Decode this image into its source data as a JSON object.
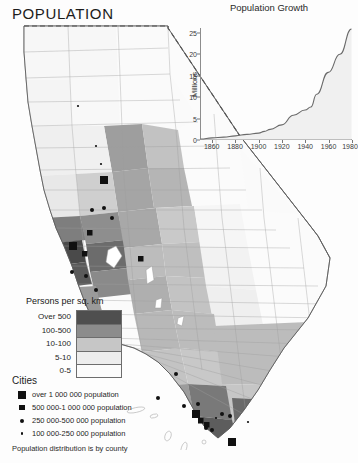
{
  "title": "POPULATION",
  "footnote": "Population distribution is by county",
  "chart_data": {
    "type": "area",
    "title": "Population Growth",
    "xlabel": "",
    "ylabel": "Millions",
    "xlim": [
      1850,
      1980
    ],
    "ylim": [
      0,
      26
    ],
    "xticks": [
      "1860",
      "1880",
      "1900",
      "1920",
      "1940",
      "1960",
      "1980"
    ],
    "yticks": [
      "0",
      "5",
      "10",
      "15",
      "20",
      "25"
    ],
    "grid": false,
    "legend": "none",
    "x": [
      1850,
      1860,
      1870,
      1880,
      1890,
      1900,
      1905,
      1910,
      1920,
      1930,
      1940,
      1945,
      1950,
      1960,
      1970,
      1980
    ],
    "values": [
      0.1,
      0.38,
      0.56,
      0.86,
      1.21,
      1.49,
      1.9,
      2.38,
      3.43,
      5.68,
      6.91,
      7.6,
      10.59,
      15.72,
      19.97,
      25.9
    ],
    "series": [
      {
        "name": "California population",
        "values": [
          0.1,
          0.38,
          0.56,
          0.86,
          1.21,
          1.49,
          1.9,
          2.38,
          3.43,
          5.68,
          6.91,
          7.6,
          10.59,
          15.72,
          19.97,
          25.9
        ]
      }
    ]
  },
  "legend_density": {
    "title": "Persons per sq. km",
    "classes": [
      {
        "label": "Over 500",
        "color": "#4f4f4f"
      },
      {
        "label": "100-500",
        "color": "#8c8c8c"
      },
      {
        "label": "10-100",
        "color": "#c6c6c6"
      },
      {
        "label": "5-10",
        "color": "#ededed"
      },
      {
        "label": "0-5",
        "color": "#fbfbfb"
      }
    ]
  },
  "legend_cities": {
    "title": "Cities",
    "items": [
      {
        "label": "over 1 000 000 population",
        "size": 8
      },
      {
        "label": "500 000-1 000 000 population",
        "size": 5.5
      },
      {
        "label": "250 000-500 000 population",
        "size": 4
      },
      {
        "label": "100 000-250 000 population",
        "size": 2.2
      }
    ]
  },
  "map": {
    "name": "california-population-choropleth",
    "caption": "California counties shaded by population density"
  }
}
